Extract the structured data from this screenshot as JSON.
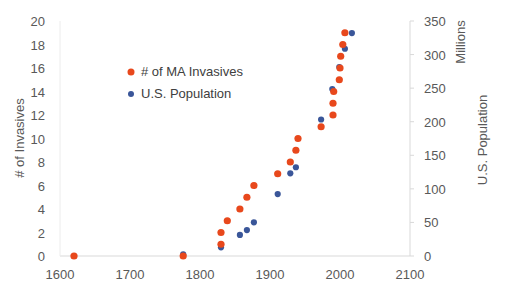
{
  "chart_data": {
    "type": "scatter",
    "title": "",
    "xlabel": "",
    "ylabel": "# of Invasives",
    "y2label": "U.S. Population",
    "y2unit_label": "Millions",
    "xlim": [
      1600,
      2100
    ],
    "ylim": [
      0,
      20
    ],
    "y2lim": [
      0,
      350
    ],
    "xticks": [
      1600,
      1700,
      1800,
      1900,
      2000,
      2100
    ],
    "yticks": [
      0,
      2,
      4,
      6,
      8,
      10,
      12,
      14,
      16,
      18,
      20
    ],
    "y2ticks": [
      0,
      50,
      100,
      150,
      200,
      250,
      300,
      350
    ],
    "grid": false,
    "legend_position": "upper-left-inside",
    "series": [
      {
        "name": "# of MA Invasives",
        "axis": "left",
        "color": "#E8481C",
        "points": [
          [
            1620,
            0
          ],
          [
            1776,
            0
          ],
          [
            1830,
            1
          ],
          [
            1830,
            2
          ],
          [
            1839,
            3
          ],
          [
            1857,
            4
          ],
          [
            1867,
            5
          ],
          [
            1877,
            6
          ],
          [
            1911,
            7
          ],
          [
            1929,
            8
          ],
          [
            1937,
            9
          ],
          [
            1940,
            10
          ],
          [
            1973,
            11
          ],
          [
            1990,
            12
          ],
          [
            1990,
            13
          ],
          [
            1991,
            14
          ],
          [
            1999,
            15
          ],
          [
            2000,
            16
          ],
          [
            2001,
            17
          ],
          [
            2004,
            18
          ],
          [
            2007,
            19
          ]
        ]
      },
      {
        "name": "U.S. Population",
        "axis": "right",
        "color": "#3A5699",
        "points": [
          [
            1620,
            0
          ],
          [
            1776,
            2.5
          ],
          [
            1830,
            12.9
          ],
          [
            1857,
            31.4
          ],
          [
            1867,
            38.6
          ],
          [
            1877,
            50.2
          ],
          [
            1911,
            92.2
          ],
          [
            1929,
            123.2
          ],
          [
            1937,
            132.2
          ],
          [
            1973,
            203.3
          ],
          [
            1989,
            248.7
          ],
          [
            1999,
            281.4
          ],
          [
            2007,
            308.7
          ],
          [
            2017,
            332
          ]
        ]
      }
    ]
  }
}
